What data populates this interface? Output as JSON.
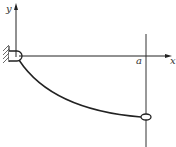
{
  "diagram": {
    "type": "mechanics-figure",
    "axes": {
      "x_label": "x",
      "y_label": "y"
    },
    "marks": {
      "rod_position_label": "a"
    },
    "colors": {
      "line": "#222222",
      "background": "#ffffff",
      "hatch": "#444444"
    }
  }
}
